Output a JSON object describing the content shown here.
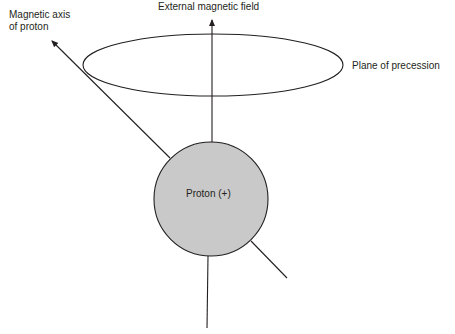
{
  "labels": {
    "magnetic_axis_line1": "Magnetic axis",
    "magnetic_axis_line2": "of proton",
    "external_field": "External magnetic field",
    "plane_of_precession": "Plane of precession",
    "proton": "Proton (+)"
  },
  "colors": {
    "stroke": "#231f20",
    "proton_fill": "#c9c9c9",
    "background": "#ffffff"
  },
  "geometry": {
    "proton": {
      "cx": 211,
      "cy": 199,
      "r": 57
    },
    "precession_ellipse": {
      "cx": 213,
      "cy": 65,
      "rx": 130,
      "ry": 31
    }
  }
}
